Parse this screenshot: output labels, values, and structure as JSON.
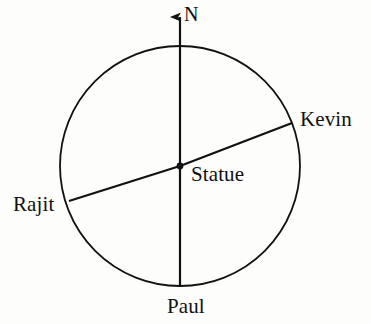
{
  "diagram": {
    "type": "compass-circle-map",
    "background_color": "#fdfdfc",
    "stroke_color": "#111111",
    "center_point": {
      "name": "Statue",
      "x": 180,
      "y": 166,
      "marker": "filled-dot"
    },
    "circle": {
      "cx": 180,
      "cy": 166,
      "r": 120,
      "stroke_width": 1.8,
      "fill": "none"
    },
    "north_arrow": {
      "label": "N",
      "from": {
        "x": 180,
        "y": 166
      },
      "to": {
        "x": 180,
        "y": 11
      },
      "arrowhead": "triangle-up"
    },
    "radii": [
      {
        "name": "kevin-radius",
        "label": "Kevin",
        "angle_deg_from_east": 21,
        "endpoint": {
          "x": 292,
          "y": 123
        }
      },
      {
        "name": "rajit-radius",
        "label": "Rajit",
        "angle_deg_from_east": 197,
        "endpoint": {
          "x": 69,
          "y": 201
        }
      },
      {
        "name": "paul-radius",
        "label": "Paul",
        "angle_deg_from_east": 270,
        "endpoint": {
          "x": 180,
          "y": 287
        }
      }
    ]
  },
  "labels": {
    "north": "N",
    "kevin": "Kevin",
    "statue": "Statue",
    "rajit": "Rajit",
    "paul": "Paul"
  }
}
